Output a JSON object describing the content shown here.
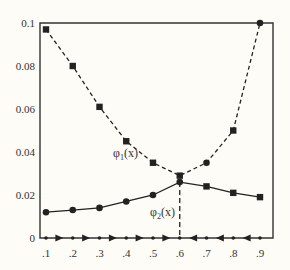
{
  "chart_data": {
    "type": "line",
    "title": "",
    "xlabel": "",
    "ylabel": "",
    "xlim": [
      0.1,
      0.9
    ],
    "ylim": [
      0,
      0.1
    ],
    "grid": false,
    "x_ticks": [
      ".1",
      ".2",
      ".3",
      ".4",
      ".5",
      ".6",
      ".7",
      ".8",
      ".9"
    ],
    "y_ticks": [
      "0",
      "0.02",
      "0.04",
      "0.06",
      "0.08",
      "0.1"
    ],
    "series": [
      {
        "name": "φ1(x)",
        "style": "dashed",
        "x": [
          0.1,
          0.2,
          0.3,
          0.4,
          0.5,
          0.6,
          0.7,
          0.8,
          0.9
        ],
        "values": [
          0.097,
          0.08,
          0.061,
          0.045,
          0.035,
          0.029,
          0.035,
          0.05,
          0.1
        ],
        "markers": [
          "square",
          "square",
          "square",
          "square",
          "square",
          "square",
          "circle",
          "square",
          "circle"
        ]
      },
      {
        "name": "φ2(x)",
        "style": "solid",
        "x": [
          0.1,
          0.2,
          0.3,
          0.4,
          0.5,
          0.6,
          0.7,
          0.8,
          0.9
        ],
        "values": [
          0.012,
          0.013,
          0.014,
          0.017,
          0.02,
          0.026,
          0.024,
          0.021,
          0.019
        ],
        "markers": [
          "circle",
          "circle",
          "circle",
          "circle",
          "circle",
          "circle",
          "square",
          "square",
          "square"
        ]
      }
    ],
    "annotations": [
      {
        "text": "φ1(x)",
        "label_main": "φ",
        "label_sub": "1",
        "label_tail": "(x)",
        "x": 0.47,
        "y": 0.043
      },
      {
        "text": "φ2(x)",
        "label_main": "φ",
        "label_sub": "2",
        "label_tail": "(x)",
        "x": 0.53,
        "y": 0.011
      },
      {
        "text": "vertical dashed line at x=0.6",
        "x": 0.6
      }
    ],
    "axis_arrows": {
      "right_pointing_between": [
        ".1",
        ".6"
      ],
      "left_pointing_between": [
        ".6",
        ".9"
      ]
    }
  }
}
